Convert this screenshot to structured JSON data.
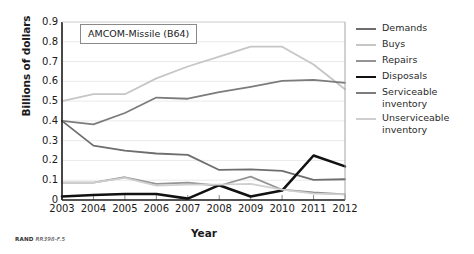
{
  "figure": {
    "credit_prefix": "RAND",
    "credit_id": "RR398-F.5",
    "panel_title": "AMCOM-Missile (B64)"
  },
  "chart_data": {
    "type": "line",
    "title": "AMCOM-Missile (B64)",
    "xlabel": "Year",
    "ylabel": "Billions of dollars",
    "categories": [
      "2003",
      "2004",
      "2005",
      "2006",
      "2007",
      "2008",
      "2009",
      "2010",
      "2011",
      "2012"
    ],
    "xtick_labels": [
      "2003",
      "2004",
      "2005",
      "2006",
      "2007",
      "2008",
      "2009",
      "2010",
      "2011",
      "2012"
    ],
    "ytick_labels": [
      "0.9",
      "0.8",
      "0.7",
      "0.6",
      "0.5",
      "0.4",
      "0.3",
      "0.2",
      "0.1",
      "0"
    ],
    "ytick_values": [
      0.9,
      0.8,
      0.7,
      0.6,
      0.5,
      0.4,
      0.3,
      0.2,
      0.1,
      0
    ],
    "ylim": [
      0,
      0.9
    ],
    "xlim": [
      2003,
      2012
    ],
    "grid": true,
    "legend_position": "right",
    "series": [
      {
        "name": "Demands",
        "color": "#6e6e6e",
        "width": 1.8,
        "values": [
          0.4,
          0.275,
          0.25,
          0.235,
          0.228,
          0.152,
          0.155,
          0.147,
          0.102,
          0.105
        ]
      },
      {
        "name": "Buys",
        "color": "#c6c6c6",
        "width": 1.8,
        "values": [
          0.5,
          0.535,
          0.535,
          0.615,
          0.675,
          0.725,
          0.775,
          0.775,
          0.685,
          0.56
        ]
      },
      {
        "name": "Repairs",
        "color": "#949494",
        "width": 1.8,
        "values": [
          0.088,
          0.088,
          0.115,
          0.082,
          0.088,
          0.072,
          0.118,
          0.052,
          0.038,
          0.028
        ]
      },
      {
        "name": "Disposals",
        "color": "#111111",
        "width": 2.6,
        "values": [
          0.018,
          0.025,
          0.03,
          0.03,
          0.007,
          0.075,
          0.018,
          0.048,
          0.225,
          0.17
        ]
      },
      {
        "name": "Serviceable inventory",
        "color": "#7c7c7c",
        "width": 1.8,
        "values": [
          0.4,
          0.382,
          0.44,
          0.518,
          0.512,
          0.545,
          0.572,
          0.602,
          0.607,
          0.592
        ]
      },
      {
        "name": "Unserviceable inventory",
        "color": "#cfcfcf",
        "width": 1.8,
        "values": [
          0.088,
          0.088,
          0.112,
          0.073,
          0.078,
          0.078,
          0.082,
          0.052,
          0.032,
          0.028
        ]
      }
    ]
  }
}
